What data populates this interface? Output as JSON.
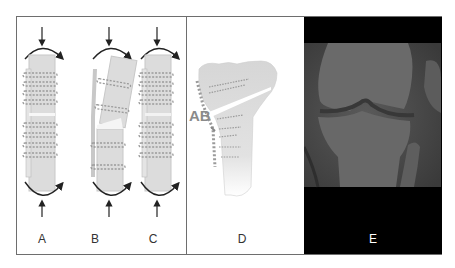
{
  "figure": {
    "panels": [
      {
        "id": "A",
        "label": "A",
        "description": "Straight bone with symmetric plate and screws, closed osteotomy"
      },
      {
        "id": "B",
        "label": "B",
        "description": "Angulated bone with opening wedge gap under load"
      },
      {
        "id": "C",
        "label": "C",
        "description": "Straight bone with plate and screws, stable osteotomy"
      },
      {
        "id": "D",
        "label": "D",
        "description": "Proximal tibia with opening-wedge osteotomy and medial plate",
        "annotation": "AB"
      },
      {
        "id": "E",
        "label": "E",
        "description": "Knee radiograph, anteroposterior view"
      }
    ]
  },
  "colors": {
    "bone": "#dcdcdc",
    "bone_edge": "#c4c4c4",
    "screw": "#9a9a9a",
    "arrow": "#222222",
    "frame": "#6e6e6e",
    "xray_bg": "#000000",
    "xray_field": "#4a4a4a",
    "label": "#333333",
    "label_e": "#ffffff"
  }
}
